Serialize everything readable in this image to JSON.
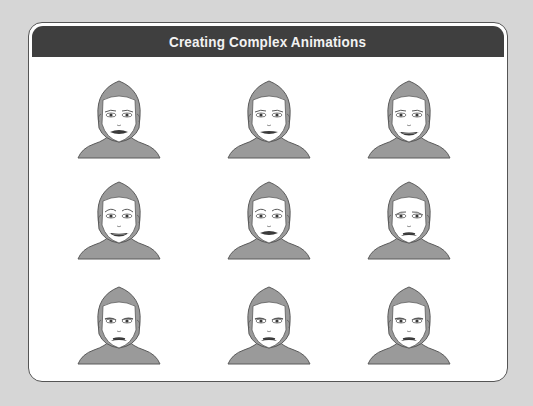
{
  "title": "Creating Complex Animations",
  "colors": {
    "background": "#d6d6d6",
    "header": "#3f3f3f",
    "header_text": "#f2f2f2",
    "skin": "#ffffff",
    "hair_body": "#9a9a9a",
    "outline": "#5a5a5a",
    "lips": "#3a3a3a"
  },
  "faces": [
    {
      "row": 1,
      "col": 1,
      "expression": "neutral"
    },
    {
      "row": 1,
      "col": 2,
      "expression": "neutral-slight-smile"
    },
    {
      "row": 1,
      "col": 3,
      "expression": "smile"
    },
    {
      "row": 2,
      "col": 1,
      "expression": "happy-raised-brows"
    },
    {
      "row": 2,
      "col": 2,
      "expression": "neutral-raised-brows"
    },
    {
      "row": 2,
      "col": 3,
      "expression": "sad"
    },
    {
      "row": 3,
      "col": 1,
      "expression": "frown-angry"
    },
    {
      "row": 3,
      "col": 2,
      "expression": "frown"
    },
    {
      "row": 3,
      "col": 3,
      "expression": "frown-sad"
    }
  ]
}
